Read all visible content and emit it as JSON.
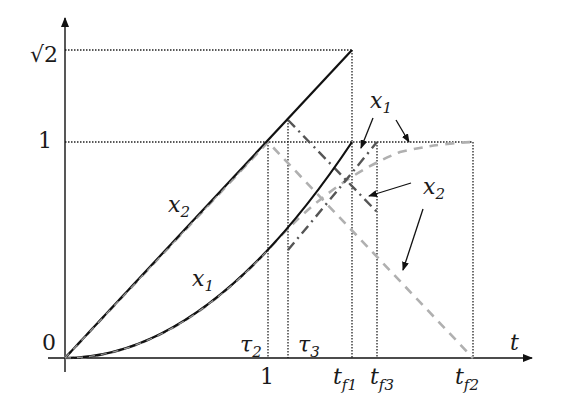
{
  "diagram": {
    "axes": {
      "x_label": "t",
      "y_ticks": [
        {
          "label": "0",
          "value": 0
        },
        {
          "label": "1",
          "value": 1
        },
        {
          "label": "√2",
          "value": 1.414
        }
      ],
      "x_ticks_below": [
        {
          "label": "1",
          "value": 1
        },
        {
          "label": "t",
          "sub": "f1"
        },
        {
          "label": "t",
          "sub": "f3"
        },
        {
          "label": "t",
          "sub": "f2"
        }
      ],
      "x_ticks_above": [
        {
          "label": "τ",
          "sub": "2"
        },
        {
          "label": "τ",
          "sub": "3"
        }
      ]
    },
    "curve_labels": {
      "x2_left": {
        "main": "x",
        "sub": "2"
      },
      "x1_left": {
        "main": "x",
        "sub": "1"
      },
      "x1_right": {
        "main": "x",
        "sub": "1"
      },
      "x2_right": {
        "main": "x",
        "sub": "2"
      }
    },
    "colors": {
      "solid": "#111111",
      "grey_dashed": "#b0b0b0",
      "dash_dot": "#555555",
      "guide": "#222222"
    }
  }
}
